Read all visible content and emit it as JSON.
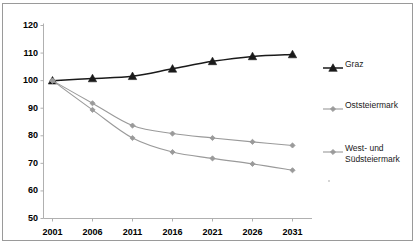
{
  "chart_data": {
    "type": "line",
    "title": "",
    "subtitle": "",
    "xlabel": "",
    "ylabel": "",
    "categories": [
      "2001",
      "2006",
      "2011",
      "2016",
      "2021",
      "2026",
      "2031"
    ],
    "x": [
      2001,
      2006,
      2011,
      2016,
      2021,
      2026,
      2031
    ],
    "ylim": [
      50,
      120
    ],
    "yticks": [
      50,
      60,
      70,
      80,
      90,
      100,
      110,
      120
    ],
    "ytick_labels": [
      "50",
      "60",
      "70",
      "80",
      "90",
      "100",
      "110",
      "120"
    ],
    "grid": false,
    "legend_position": "right",
    "series": [
      {
        "name": "Graz",
        "values": [
          100,
          100.8,
          101.6,
          104.3,
          107.0,
          108.8,
          109.5
        ],
        "color": "#1a1a1a",
        "marker": "triangle"
      },
      {
        "name": "Oststeiermark",
        "values": [
          100,
          91.8,
          83.7,
          80.8,
          79.2,
          77.8,
          76.5
        ],
        "color": "#9a9a9a",
        "marker": "diamond"
      },
      {
        "name": "West- und\nSüdsteiermark",
        "values": [
          100,
          89.4,
          79.2,
          74.1,
          71.8,
          69.8,
          67.5
        ],
        "color": "#9a9a9a",
        "marker": "diamond"
      }
    ],
    "axis_color": "#b0b0b0",
    "frame_color": "#9a9a9a"
  },
  "legend": {
    "entries": [
      {
        "label": "Graz"
      },
      {
        "label": "Oststeiermark"
      },
      {
        "label": "West- und\nSüdsteiermark"
      }
    ]
  }
}
